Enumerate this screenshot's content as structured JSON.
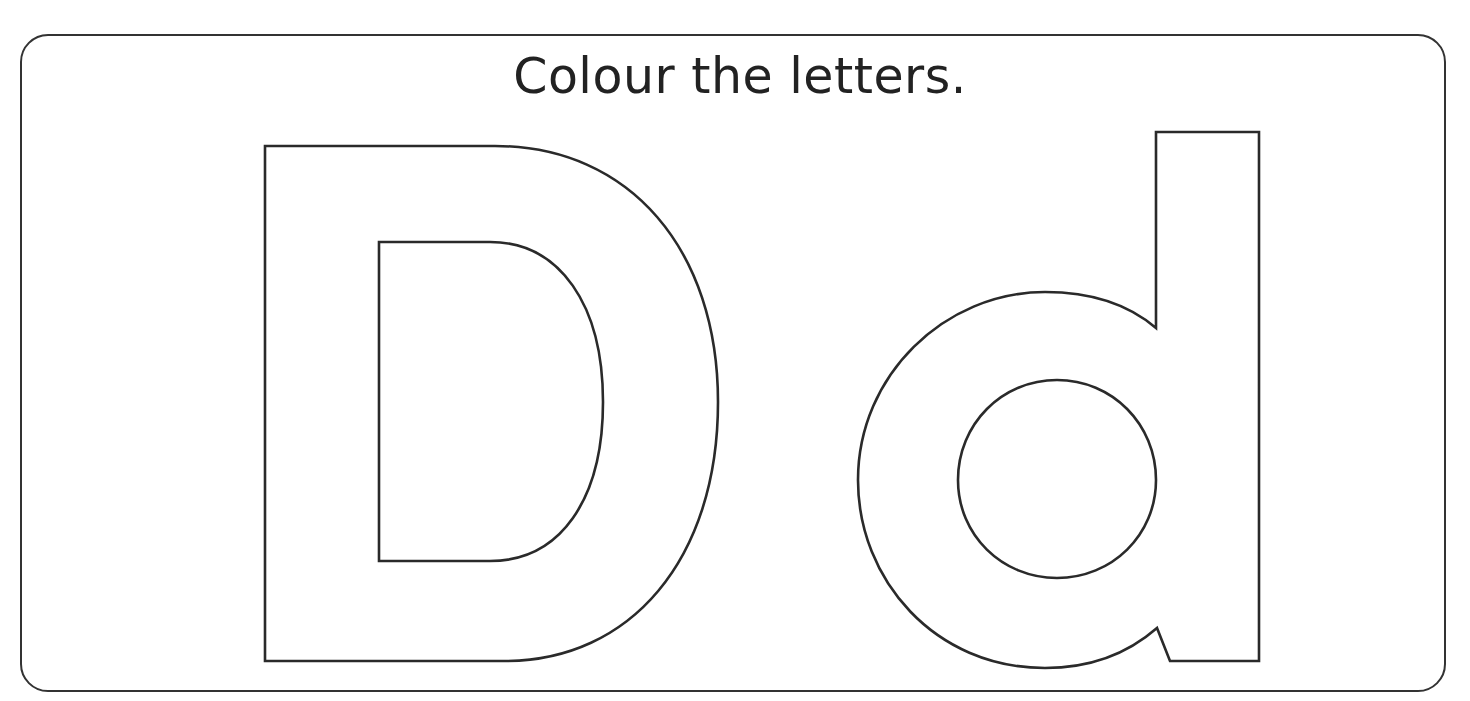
{
  "worksheet": {
    "instruction": "Colour the letters.",
    "letters": [
      {
        "glyph": "D",
        "case": "uppercase",
        "style": "outline"
      },
      {
        "glyph": "d",
        "case": "lowercase",
        "style": "outline"
      }
    ]
  },
  "colors": {
    "outline": "#2a2a2a",
    "text": "#222222",
    "background": "#ffffff",
    "frame": "#333333"
  }
}
